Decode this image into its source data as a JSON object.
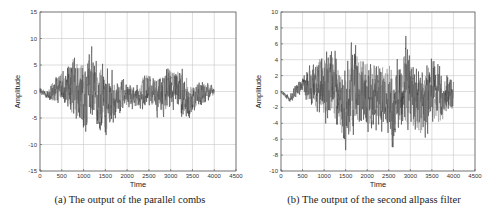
{
  "chart_data": [
    {
      "type": "line",
      "title": "",
      "caption": "(a) The output of the parallel combs",
      "xlabel": "Time",
      "ylabel": "Amplitude",
      "xlim": [
        0,
        4500
      ],
      "ylim": [
        -15,
        15
      ],
      "xticks": [
        0,
        500,
        1000,
        1500,
        2000,
        2500,
        3000,
        3500,
        4000,
        4500
      ],
      "yticks": [
        -15,
        -10,
        -5,
        0,
        5,
        10,
        15
      ],
      "grid": true,
      "legend": null,
      "series": [
        {
          "name": "parallel combs output",
          "sample_count": 4000,
          "x_range": [
            0,
            4000
          ],
          "upper_envelope": [
            [
              0,
              1
            ],
            [
              150,
              0.5
            ],
            [
              300,
              3
            ],
            [
              450,
              5
            ],
            [
              600,
              5
            ],
            [
              750,
              10
            ],
            [
              900,
              9
            ],
            [
              1050,
              9
            ],
            [
              1150,
              11.5
            ],
            [
              1300,
              7
            ],
            [
              1450,
              8
            ],
            [
              1600,
              5
            ],
            [
              1800,
              3.5
            ],
            [
              2000,
              2.5
            ],
            [
              2200,
              1.5
            ],
            [
              2400,
              5
            ],
            [
              2600,
              4
            ],
            [
              2800,
              5
            ],
            [
              2950,
              7
            ],
            [
              3100,
              6
            ],
            [
              3300,
              6
            ],
            [
              3500,
              3
            ],
            [
              3700,
              3
            ],
            [
              3900,
              2
            ],
            [
              4000,
              1
            ]
          ],
          "lower_envelope": [
            [
              0,
              -0.5
            ],
            [
              150,
              -1.5
            ],
            [
              300,
              -3
            ],
            [
              400,
              -4
            ],
            [
              500,
              -2
            ],
            [
              700,
              -7
            ],
            [
              900,
              -9
            ],
            [
              1100,
              -10.5
            ],
            [
              1300,
              -8
            ],
            [
              1500,
              -11
            ],
            [
              1700,
              -7
            ],
            [
              1900,
              -4
            ],
            [
              2100,
              -4
            ],
            [
              2300,
              -4
            ],
            [
              2500,
              -3.5
            ],
            [
              2700,
              -6
            ],
            [
              2900,
              -6
            ],
            [
              3100,
              -4
            ],
            [
              3300,
              -7.5
            ],
            [
              3500,
              -5
            ],
            [
              3700,
              -4
            ],
            [
              3900,
              -2
            ],
            [
              4000,
              -1
            ]
          ]
        }
      ]
    },
    {
      "type": "line",
      "title": "",
      "caption": "(b) The output of the second allpass filter",
      "xlabel": "Time",
      "ylabel": "Amplitude",
      "xlim": [
        0,
        4500
      ],
      "ylim": [
        -10,
        10
      ],
      "xticks": [
        0,
        500,
        1000,
        1500,
        2000,
        2500,
        3000,
        3500,
        4000,
        4500
      ],
      "yticks": [
        -10,
        -8,
        -6,
        -4,
        -2,
        0,
        2,
        4,
        6,
        8,
        10
      ],
      "grid": true,
      "legend": null,
      "series": [
        {
          "name": "second allpass filter output",
          "sample_count": 4000,
          "x_range": [
            0,
            4000
          ],
          "upper_envelope": [
            [
              0,
              0.3
            ],
            [
              200,
              -0.5
            ],
            [
              350,
              1.5
            ],
            [
              500,
              2
            ],
            [
              600,
              4
            ],
            [
              800,
              5
            ],
            [
              900,
              7
            ],
            [
              1100,
              6
            ],
            [
              1200,
              7.5
            ],
            [
              1400,
              4
            ],
            [
              1600,
              6.5
            ],
            [
              1700,
              9
            ],
            [
              1900,
              6
            ],
            [
              2100,
              6
            ],
            [
              2300,
              5.5
            ],
            [
              2500,
              7
            ],
            [
              2600,
              5
            ],
            [
              2800,
              6
            ],
            [
              2900,
              9
            ],
            [
              3100,
              5
            ],
            [
              3200,
              4
            ],
            [
              3400,
              5
            ],
            [
              3500,
              7
            ],
            [
              3700,
              4
            ],
            [
              3900,
              3
            ],
            [
              4000,
              2
            ]
          ],
          "lower_envelope": [
            [
              0,
              -0.3
            ],
            [
              200,
              -1.5
            ],
            [
              350,
              -1
            ],
            [
              500,
              -0.5
            ],
            [
              600,
              -2
            ],
            [
              800,
              -4
            ],
            [
              1000,
              -5
            ],
            [
              1100,
              -6.5
            ],
            [
              1300,
              -6
            ],
            [
              1500,
              -9
            ],
            [
              1700,
              -7
            ],
            [
              1900,
              -6
            ],
            [
              2100,
              -7
            ],
            [
              2300,
              -6
            ],
            [
              2500,
              -7
            ],
            [
              2600,
              -10
            ],
            [
              2800,
              -6
            ],
            [
              3000,
              -8
            ],
            [
              3200,
              -7.5
            ],
            [
              3300,
              -8
            ],
            [
              3500,
              -6
            ],
            [
              3700,
              -6
            ],
            [
              3900,
              -4
            ],
            [
              4000,
              -3
            ]
          ]
        }
      ]
    }
  ],
  "panels": [
    {
      "caption": "(a) The output of the parallel combs",
      "xlabel": "Time",
      "ylabel": "Amplitude"
    },
    {
      "caption": "(b) The output of the second allpass filter",
      "xlabel": "Time",
      "ylabel": "Amplitude"
    }
  ]
}
